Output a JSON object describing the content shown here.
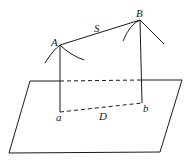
{
  "diagram": {
    "labels": {
      "point_A": "A",
      "point_B": "B",
      "span_S": "S",
      "foot_a": "a",
      "foot_b": "b",
      "horizontal_D": "D"
    },
    "colors": {
      "stroke": "#1a1a1a",
      "background": "#ffffff"
    }
  }
}
